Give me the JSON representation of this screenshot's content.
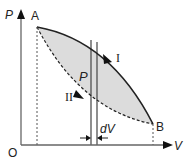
{
  "diagram": {
    "type": "pv-cycle",
    "axes": {
      "y_label": "P",
      "x_label": "V",
      "origin_label": "O"
    },
    "points": [
      {
        "name": "A",
        "label": "A"
      },
      {
        "name": "B",
        "label": "B"
      }
    ],
    "curves": [
      {
        "name": "I",
        "label": "I",
        "style": "solid",
        "direction": "A to B"
      },
      {
        "name": "II",
        "label": "II",
        "style": "dashed",
        "direction": "B to A"
      }
    ],
    "strip": {
      "pressure_label": "P",
      "width_label": "dV"
    },
    "colors": {
      "fill": "#dcdcdc",
      "line": "#222222",
      "axis": "#555555"
    }
  }
}
